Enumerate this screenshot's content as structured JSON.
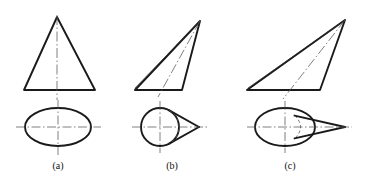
{
  "figure": {
    "background_color": "#ffffff",
    "line_color": "#1a1a1a",
    "centerline_color": "#555555",
    "hidden_line_color": "#555555"
  },
  "labels": [
    {
      "text": "(a)",
      "x": 58,
      "y": 160
    },
    {
      "text": "(b)",
      "x": 172,
      "y": 160
    },
    {
      "text": "(c)",
      "x": 290,
      "y": 160
    }
  ],
  "panels": [
    {
      "id": "panel-a",
      "label": "(a)",
      "description": "right circular cone",
      "front_view": {
        "type": "triangle",
        "apex": {
          "x": 57,
          "y": 17
        },
        "base_left": {
          "x": 24,
          "y": 90
        },
        "base_right": {
          "x": 95,
          "y": 90
        },
        "axis": {
          "x1": 57,
          "y1": 15,
          "x2": 57,
          "y2": 100
        }
      },
      "top_view": {
        "type": "ellipse",
        "cx": 58,
        "cy": 127,
        "rx": 33,
        "ry": 19,
        "h_centerline": {
          "x1": 16,
          "y1": 127,
          "x2": 101,
          "y2": 127
        },
        "v_centerline": {
          "x1": 58,
          "y1": 100,
          "x2": 58,
          "y2": 155
        }
      }
    },
    {
      "id": "panel-b",
      "label": "(b)",
      "description": "oblique cone with circular base",
      "front_view": {
        "type": "oblique-triangle",
        "apex": {
          "x": 200,
          "y": 21
        },
        "base_left": {
          "x": 135,
          "y": 90
        },
        "base_right": {
          "x": 182,
          "y": 90
        },
        "axis": {
          "x1": 200,
          "y1": 21,
          "x2": 158,
          "y2": 97
        }
      },
      "top_view": {
        "type": "circle-with-tangent-point",
        "cx": 160,
        "cy": 127,
        "r": 19,
        "point": {
          "x": 199,
          "y": 127
        },
        "hidden_arc_x": 178,
        "h_centerline": {
          "x1": 132,
          "y1": 127,
          "x2": 208,
          "y2": 127
        },
        "v_centerline": {
          "x1": 160,
          "y1": 101,
          "x2": 160,
          "y2": 153
        }
      }
    },
    {
      "id": "panel-c",
      "label": "(c)",
      "description": "oblique cone with elliptical base",
      "front_view": {
        "type": "oblique-triangle",
        "apex": {
          "x": 345,
          "y": 20
        },
        "base_left": {
          "x": 247,
          "y": 90
        },
        "base_right": {
          "x": 320,
          "y": 90
        },
        "axis": {
          "x1": 345,
          "y1": 20,
          "x2": 283,
          "y2": 99
        }
      },
      "top_view": {
        "type": "ellipse-with-tangent-point",
        "cx": 285,
        "cy": 127,
        "rx": 30,
        "ry": 19,
        "point": {
          "x": 345,
          "y": 127
        },
        "hidden_arc_x": 311,
        "h_centerline": {
          "x1": 247,
          "y1": 127,
          "x2": 352,
          "y2": 127
        },
        "v_centerline": {
          "x1": 285,
          "y1": 101,
          "x2": 285,
          "y2": 153
        }
      }
    }
  ]
}
